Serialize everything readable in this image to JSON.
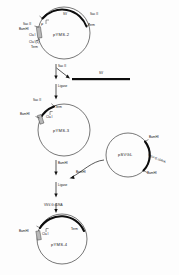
{
  "figure": {
    "kind": "plasmid-cloning-scheme",
    "background_color": "#fdfdfd",
    "ink_color": "#111111"
  },
  "plasmid_1": {
    "name": "pYMS-2",
    "labels": {
      "top_insert": "SV",
      "sac2_right": "Sac II",
      "term_right": "Term",
      "sac2_left": "Sac II",
      "bamhi_left": "BamHI",
      "cut1": "Cla I",
      "cut2": "Cla I(1)",
      "term_left": "Term",
      "origin_mark": "P"
    }
  },
  "step_1": {
    "enzyme": "Sac II",
    "ligase": "Ligase"
  },
  "fragment": {
    "label": "SV",
    "color": "#0d0d0d"
  },
  "plasmid_2": {
    "name": "pYMS-3",
    "labels": {
      "sac2": "Sac II",
      "bamhi": "BamHI",
      "term": "Term",
      "cla1": "Cla I",
      "ligase_in": "Ligase"
    }
  },
  "plasmid_3": {
    "name": "pSVGL",
    "labels": {
      "bamhi_top": "BamHI",
      "bamhi_bottom": "BamHI",
      "insert": "VSV-G cDNA"
    }
  },
  "step_2": {
    "enzyme_left": "BamHI",
    "enzyme_right": "BamHI",
    "ligase": "Ligase"
  },
  "plasmid_4": {
    "name": "pYMS-4",
    "labels": {
      "insert": "VSV-G cDNA",
      "term": "Term",
      "cla1": "Cla I",
      "bamhi": "BamHI"
    }
  }
}
